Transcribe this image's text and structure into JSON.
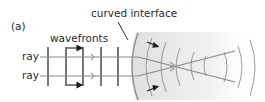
{
  "figure": {
    "panel_label": "(a)",
    "labels": {
      "wavefronts": "wavefronts",
      "interface": "curved interface",
      "ray_top": "ray",
      "ray_bottom": "ray"
    },
    "colors": {
      "line": "#1c1c1c",
      "ray": "#8a8a8a",
      "medium_fill": "#e6e6e6",
      "arc": "#8c8c8c"
    },
    "geometry": {
      "wavefront_x": [
        48,
        66,
        83,
        101,
        118
      ],
      "wavefront_y_top": 47,
      "wavefront_y_bottom": 86,
      "ray_y": [
        57,
        76
      ],
      "interface_x": 136
    }
  }
}
